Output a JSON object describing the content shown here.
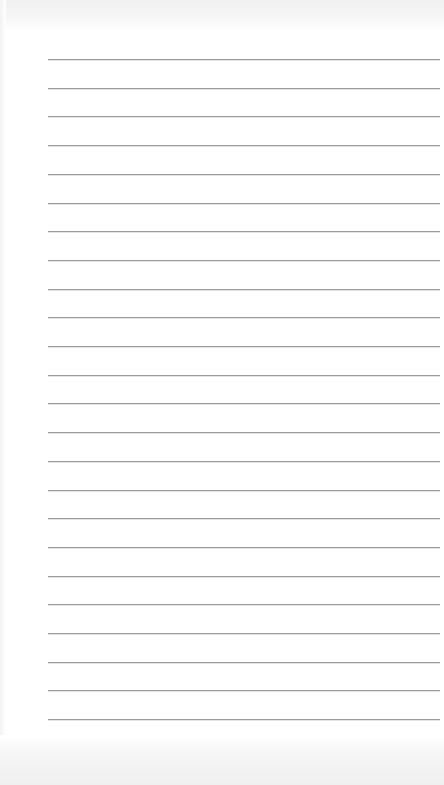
{
  "page": {
    "type": "lined-paper",
    "background_color": "#ffffff",
    "line_color": "#9c9c9c",
    "line_count": 24,
    "first_line_y": 59,
    "line_spacing": 28.7,
    "line_left": 48,
    "line_right": 440,
    "text": ""
  }
}
